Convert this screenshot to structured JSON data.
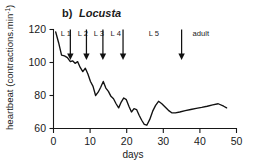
{
  "figure": {
    "panel_letter": "b)",
    "species": "Locusta",
    "background_color": "#ffffff",
    "line_color": "#111111"
  },
  "chart_data": {
    "type": "line",
    "title": "b) Locusta",
    "xlabel": "days",
    "ylabel": "heartbeat (contractions.min-1)",
    "ylabel_base": "heartbeat (contractions.min",
    "ylabel_sup": "-1",
    "ylabel_close": ")",
    "xlim": [
      0,
      50
    ],
    "ylim": [
      60,
      120
    ],
    "xticks": [
      0,
      10,
      20,
      30,
      40,
      50
    ],
    "xtick_labels": [
      "0",
      "10",
      "20",
      "30",
      "40",
      "50"
    ],
    "yticks": [
      60,
      80,
      100,
      120
    ],
    "ytick_labels": [
      "60",
      "80",
      "100",
      "120"
    ],
    "grid": false,
    "legend": false,
    "series": [
      {
        "name": "heartbeat",
        "x": [
          0.6,
          1.4,
          2.2,
          3.0,
          3.8,
          4.6,
          5.2,
          5.9,
          6.6,
          7.3,
          8.0,
          8.7,
          9.4,
          10.1,
          10.8,
          11.5,
          12.2,
          12.9,
          13.6,
          14.3,
          15.0,
          15.7,
          16.4,
          17.1,
          17.8,
          18.5,
          19.2,
          19.9,
          20.6,
          21.3,
          22.0,
          22.7,
          23.4,
          24.1,
          24.8,
          25.5,
          26.3,
          27.1,
          27.9,
          28.7,
          29.6,
          30.5,
          31.4,
          32.3,
          33.3,
          34.5,
          36.0,
          37.5,
          39.0,
          40.5,
          42.0,
          43.5,
          45.0,
          46.5,
          47.3
        ],
        "y": [
          118.5,
          112.0,
          104.5,
          104.0,
          103.0,
          100.5,
          101.0,
          99.5,
          100.5,
          97.0,
          94.5,
          96.5,
          93.0,
          88.5,
          85.5,
          80.0,
          82.0,
          85.0,
          88.5,
          84.5,
          82.5,
          79.5,
          78.0,
          75.0,
          72.5,
          76.0,
          78.5,
          77.5,
          73.5,
          70.0,
          72.0,
          71.5,
          68.0,
          65.0,
          62.5,
          62.0,
          65.5,
          70.5,
          74.0,
          76.5,
          75.0,
          73.0,
          71.0,
          69.5,
          69.5,
          70.0,
          70.8,
          71.5,
          72.2,
          72.8,
          73.5,
          74.3,
          75.0,
          73.5,
          72.5
        ]
      }
    ],
    "stage_markers": [
      {
        "label": "L 1",
        "label_x": 2.0,
        "arrow_x": 4.6,
        "arrow_tip_y": 101.5
      },
      {
        "label": "L 2",
        "label_x": 6.6,
        "arrow_x": 9.0,
        "arrow_tip_y": 101.5
      },
      {
        "label": "L 3",
        "label_x": 11.0,
        "arrow_x": 13.5,
        "arrow_tip_y": 101.5
      },
      {
        "label": "L 4",
        "label_x": 15.6,
        "arrow_x": 19.0,
        "arrow_tip_y": 101.5
      },
      {
        "label": "L 5",
        "label_x": 26.0,
        "arrow_x": null,
        "arrow_tip_y": null
      },
      {
        "label": "adult",
        "label_x": 38.0,
        "arrow_x": 35.0,
        "arrow_tip_y": 101.5
      }
    ]
  }
}
